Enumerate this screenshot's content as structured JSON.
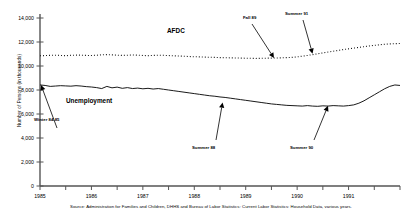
{
  "chart_data": {
    "type": "line",
    "title": "",
    "xlabel": "",
    "ylabel": "Number of Persons (in thousands)",
    "ylim": [
      0,
      14000
    ],
    "xlim": [
      1985,
      1992
    ],
    "yticks": [
      "0",
      "2,000",
      "4,000",
      "6,000",
      "8,000",
      "10,000",
      "12,000",
      "14,000"
    ],
    "ytick_values": [
      0,
      2000,
      4000,
      6000,
      8000,
      10000,
      12000,
      14000
    ],
    "xticks": [
      "1985",
      "1986",
      "1987",
      "1988",
      "1989",
      "1990",
      "1991"
    ],
    "xtick_values": [
      1985,
      1986,
      1987,
      1988,
      1989,
      1990,
      1991
    ],
    "grid": false,
    "legend_position": "inline-labels",
    "series": [
      {
        "name": "AFDC",
        "style": "dotted",
        "x": [
          1985.0,
          1985.1,
          1985.2,
          1985.3,
          1985.4,
          1985.5,
          1985.6,
          1985.7,
          1985.8,
          1985.9,
          1986.0,
          1986.1,
          1986.2,
          1986.3,
          1986.4,
          1986.5,
          1986.6,
          1986.7,
          1986.8,
          1986.9,
          1987.0,
          1987.1,
          1987.2,
          1987.3,
          1987.4,
          1987.5,
          1987.6,
          1987.7,
          1987.8,
          1987.9,
          1988.0,
          1988.1,
          1988.2,
          1988.3,
          1988.4,
          1988.5,
          1988.6,
          1988.7,
          1988.8,
          1988.9,
          1989.0,
          1989.1,
          1989.2,
          1989.3,
          1989.4,
          1989.5,
          1989.6,
          1989.7,
          1989.8,
          1989.9,
          1990.0,
          1990.1,
          1990.2,
          1990.3,
          1990.4,
          1990.5,
          1990.6,
          1990.7,
          1990.8,
          1990.9,
          1991.0,
          1991.1,
          1991.2,
          1991.3,
          1991.4,
          1991.5,
          1991.6,
          1991.7,
          1991.8,
          1991.9,
          1992.0
        ],
        "values": [
          10850,
          10870,
          10890,
          10900,
          10880,
          10860,
          10890,
          10910,
          10900,
          10880,
          10870,
          10900,
          10930,
          10950,
          10930,
          10900,
          10880,
          10900,
          10920,
          10900,
          10880,
          10860,
          10880,
          10900,
          10890,
          10870,
          10850,
          10830,
          10810,
          10790,
          10770,
          10760,
          10740,
          10730,
          10720,
          10700,
          10690,
          10680,
          10670,
          10660,
          10650,
          10640,
          10630,
          10640,
          10650,
          10660,
          10670,
          10680,
          10700,
          10720,
          10760,
          10820,
          10880,
          10950,
          11020,
          11090,
          11160,
          11230,
          11300,
          11370,
          11430,
          11490,
          11550,
          11610,
          11670,
          11720,
          11770,
          11810,
          11840,
          11860,
          11880
        ]
      },
      {
        "name": "Unemployment",
        "style": "solid",
        "x": [
          1985.0,
          1985.1,
          1985.2,
          1985.3,
          1985.4,
          1985.5,
          1985.6,
          1985.7,
          1985.8,
          1985.9,
          1986.0,
          1986.1,
          1986.2,
          1986.3,
          1986.4,
          1986.5,
          1986.6,
          1986.7,
          1986.8,
          1986.9,
          1987.0,
          1987.1,
          1987.2,
          1987.3,
          1987.4,
          1987.5,
          1987.6,
          1987.7,
          1987.8,
          1987.9,
          1988.0,
          1988.1,
          1988.2,
          1988.3,
          1988.4,
          1988.5,
          1988.6,
          1988.7,
          1988.8,
          1988.9,
          1989.0,
          1989.1,
          1989.2,
          1989.3,
          1989.4,
          1989.5,
          1989.6,
          1989.7,
          1989.8,
          1989.9,
          1990.0,
          1990.1,
          1990.2,
          1990.3,
          1990.4,
          1990.5,
          1990.6,
          1990.7,
          1990.8,
          1990.9,
          1991.0,
          1991.1,
          1991.2,
          1991.3,
          1991.4,
          1991.5,
          1991.6,
          1991.7,
          1991.8,
          1991.9,
          1992.0
        ],
        "values": [
          8420,
          8380,
          8300,
          8330,
          8360,
          8340,
          8320,
          8360,
          8330,
          8280,
          8250,
          8200,
          8120,
          8300,
          8180,
          8240,
          8140,
          8200,
          8120,
          8160,
          8100,
          8140,
          8080,
          8120,
          8060,
          8000,
          7940,
          7880,
          7820,
          7760,
          7700,
          7640,
          7580,
          7520,
          7480,
          7420,
          7380,
          7320,
          7260,
          7200,
          7140,
          7080,
          7020,
          6960,
          6900,
          6840,
          6800,
          6760,
          6720,
          6700,
          6680,
          6660,
          6700,
          6660,
          6640,
          6680,
          6660,
          6700,
          6680,
          6660,
          6700,
          6760,
          6900,
          7100,
          7350,
          7600,
          7850,
          8100,
          8300,
          8420,
          8380
        ]
      }
    ],
    "annotations": [
      {
        "label": "Winter 84-85",
        "target_x": 1985.02,
        "target_y": 8420
      },
      {
        "label": "Summer 88",
        "target_x": 1988.55,
        "target_y": 6960
      },
      {
        "label": "Summer 90",
        "target_x": 1990.6,
        "target_y": 6680
      },
      {
        "label": "Fall 89",
        "target_x": 1989.55,
        "target_y": 10660
      },
      {
        "label": "Summer 91",
        "target_x": 1990.3,
        "target_y": 11020
      }
    ]
  },
  "source_note": "Source: Administration for Families and Children, DHHS and Bureau of Labor Statistics: Current Labor Statistics: Household Data, various years."
}
